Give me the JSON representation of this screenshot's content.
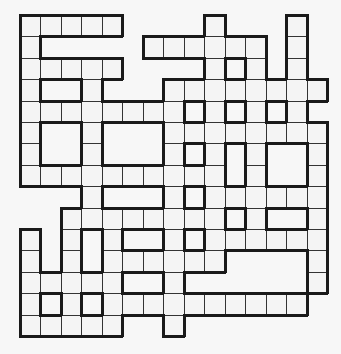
{
  "puzzle": {
    "type": "crossword-grid",
    "rows": 15,
    "cols": 15,
    "colors": {
      "cell": "#f4f4f4",
      "line": "#333333",
      "border": "#1a1a1a",
      "background": "#f7f7f7"
    },
    "grid": [
      "111110000100010",
      "100000111111010",
      "111110000101010",
      "100100011111111",
      "111111110101010",
      "100100011111111",
      "100100010101001",
      "111111111101001",
      "000100010111111",
      "001111111101001",
      "101010010111111",
      "101011111100001",
      "111110010000001",
      "101011111111110",
      "111110010000000"
    ]
  }
}
